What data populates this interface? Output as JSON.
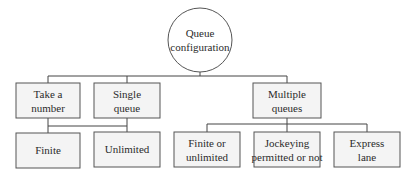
{
  "diagram": {
    "type": "tree",
    "root": {
      "line1": "Queue",
      "line2": "configuration"
    },
    "level2": [
      {
        "line1": "Take a",
        "line2": "number"
      },
      {
        "line1": "Single",
        "line2": "queue"
      },
      {
        "line1": "Multiple",
        "line2": "queues"
      }
    ],
    "level3": [
      {
        "line1": "Finite",
        "line2": ""
      },
      {
        "line1": "Unlimited",
        "line2": ""
      },
      {
        "line1": "Finite or",
        "line2": "unlimited"
      },
      {
        "line1": "Jockeying",
        "line2": "permitted or not"
      },
      {
        "line1": "Express",
        "line2": "lane"
      }
    ],
    "edges": [
      {
        "from": "Queue configuration",
        "to": "Take a number"
      },
      {
        "from": "Queue configuration",
        "to": "Single queue"
      },
      {
        "from": "Queue configuration",
        "to": "Multiple queues"
      },
      {
        "from": "Take a number / Single queue",
        "to": "Finite"
      },
      {
        "from": "Take a number / Single queue",
        "to": "Unlimited"
      },
      {
        "from": "Multiple queues",
        "to": "Finite or unlimited"
      },
      {
        "from": "Multiple queues",
        "to": "Jockeying permitted or not"
      },
      {
        "from": "Multiple queues",
        "to": "Express lane"
      }
    ],
    "colors": {
      "box_fill": "#f4f4f4",
      "stroke": "#555555",
      "text": "#2b2b2b"
    }
  }
}
